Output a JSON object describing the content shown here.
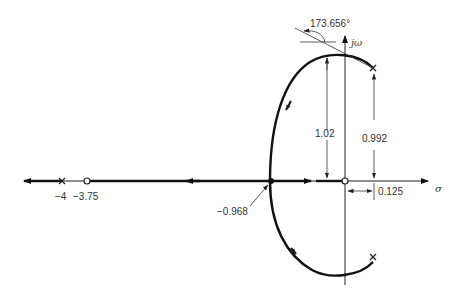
{
  "diagram": {
    "type": "root-locus",
    "axes": {
      "real_label": "σ",
      "imag_label": "jω"
    },
    "poles": [
      {
        "re": -4,
        "im": 0,
        "label": "−4"
      },
      {
        "re": -0.125,
        "im": 0.992,
        "label": ""
      },
      {
        "re": -0.125,
        "im": -0.992,
        "label": ""
      }
    ],
    "zeros": [
      {
        "re": -3.75,
        "im": 0,
        "label": "−3.75"
      },
      {
        "re": 0,
        "im": 0,
        "label": ""
      }
    ],
    "annotations": {
      "angle_of_departure": "173.656°",
      "breakin_point": "−0.968",
      "max_height": "1.02",
      "pole_height": "0.992",
      "pole_offset": "0.125"
    }
  }
}
